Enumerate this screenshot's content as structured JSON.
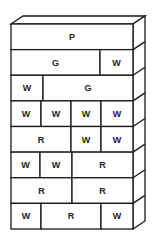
{
  "diagram": {
    "type": "brick-wall-stack",
    "rows": [
      {
        "bricks": [
          {
            "label": "P",
            "x0": 11,
            "x1": 133
          }
        ]
      },
      {
        "bricks": [
          {
            "label": "G",
            "x0": 11,
            "x1": 100
          },
          {
            "label": "W",
            "x0": 100,
            "x1": 133
          }
        ]
      },
      {
        "bricks": [
          {
            "label": "W",
            "x0": 11,
            "x1": 43
          },
          {
            "label": "G",
            "x0": 43,
            "x1": 133
          }
        ]
      },
      {
        "bricks": [
          {
            "label": "W",
            "x0": 11,
            "x1": 41
          },
          {
            "label": "W",
            "x0": 41,
            "x1": 71
          },
          {
            "label": "W",
            "x0": 71,
            "x1": 101
          },
          {
            "label": "W",
            "x0": 101,
            "x1": 133
          }
        ]
      },
      {
        "bricks": [
          {
            "label": "R",
            "x0": 11,
            "x1": 71
          },
          {
            "label": "W",
            "x0": 71,
            "x1": 101
          },
          {
            "label": "W",
            "x0": 101,
            "x1": 133
          }
        ]
      },
      {
        "bricks": [
          {
            "label": "W",
            "x0": 11,
            "x1": 40
          },
          {
            "label": "W",
            "x0": 40,
            "x1": 72
          },
          {
            "label": "R",
            "x0": 72,
            "x1": 133
          }
        ]
      },
      {
        "bricks": [
          {
            "label": "R",
            "x0": 11,
            "x1": 72
          },
          {
            "label": "R",
            "x0": 72,
            "x1": 133
          }
        ]
      },
      {
        "bricks": [
          {
            "label": "W",
            "x0": 11,
            "x1": 41
          },
          {
            "label": "R",
            "x0": 41,
            "x1": 101
          },
          {
            "label": "W",
            "x0": 101,
            "x1": 133
          }
        ]
      }
    ]
  }
}
